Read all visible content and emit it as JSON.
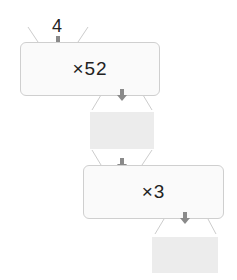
{
  "diagram": {
    "start_value": "4",
    "steps": [
      {
        "operation": "×52",
        "result": ""
      },
      {
        "operation": "×3",
        "result": ""
      }
    ]
  },
  "colors": {
    "box_fill": "#fafafa",
    "box_border": "#cfcfcf",
    "answer_fill": "#ececec",
    "arrow": "#8a8a8a",
    "funnel_line": "#cccccc"
  }
}
